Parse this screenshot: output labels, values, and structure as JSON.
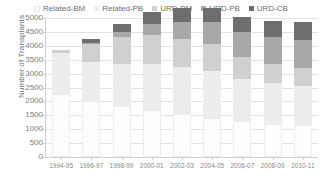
{
  "chart_data": {
    "type": "bar",
    "subtype": "stacked-bar",
    "title": "",
    "xlabel": "",
    "ylabel": "Number of Transplants",
    "ylim": [
      0,
      5000
    ],
    "ytick_step": 500,
    "ytick_labels": [
      "5000",
      "4500",
      "4000",
      "3500",
      "3000",
      "2500",
      "2000",
      "1500",
      "1000",
      "500",
      "0"
    ],
    "grid": true,
    "legend_position": "top",
    "categories": [
      "1994-95",
      "1996-97",
      "1998-99",
      "2000-01",
      "2002-03",
      "2004-05",
      "2006-07",
      "2008-09",
      "2010-11"
    ],
    "series": [
      {
        "name": "Related-BM",
        "color": "#fdfdfd",
        "values": [
          2250,
          2000,
          1850,
          1700,
          1550,
          1400,
          1300,
          1200,
          1150
        ]
      },
      {
        "name": "Related-PB",
        "color": "#ededed",
        "values": [
          1480,
          1420,
          1500,
          1650,
          1700,
          1700,
          1500,
          1450,
          1400
        ]
      },
      {
        "name": "URD-BM",
        "color": "#d0d0d0",
        "values": [
          120,
          630,
          950,
          1050,
          1000,
          950,
          800,
          700,
          650
        ]
      },
      {
        "name": "URD-PB",
        "color": "#a8a8a8",
        "values": [
          0,
          50,
          180,
          380,
          620,
          800,
          900,
          950,
          1000
        ]
      },
      {
        "name": "URD-CB",
        "color": "#6e6e6e",
        "values": [
          0,
          150,
          320,
          420,
          480,
          500,
          550,
          600,
          650
        ]
      }
    ],
    "totals": [
      3850,
      4250,
      4800,
      5200,
      5350,
      5350,
      5050,
      4900,
      4850
    ]
  },
  "axis": {
    "y_title": "Number of Transplants"
  }
}
